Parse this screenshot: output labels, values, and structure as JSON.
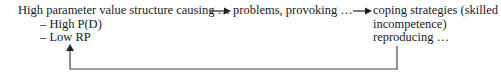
{
  "diagram": {
    "type": "feedback-loop",
    "nodes": [
      {
        "id": "structure",
        "label": "High parameter value structure causing …",
        "sub_items": [
          "– High P(D)",
          "– Low RP"
        ]
      },
      {
        "id": "problems",
        "label": "problems, provoking …"
      },
      {
        "id": "coping",
        "lines": [
          "coping strategies (skilled",
          "incompetence)",
          "reproducing …"
        ]
      }
    ],
    "edges": [
      {
        "from": "structure",
        "to": "problems"
      },
      {
        "from": "problems",
        "to": "coping"
      },
      {
        "from": "coping",
        "to": "structure",
        "style": "feedback-loop"
      }
    ],
    "colors": {
      "text": "#1a1a1a",
      "arrow": "#333333",
      "background": "#ffffff"
    }
  }
}
